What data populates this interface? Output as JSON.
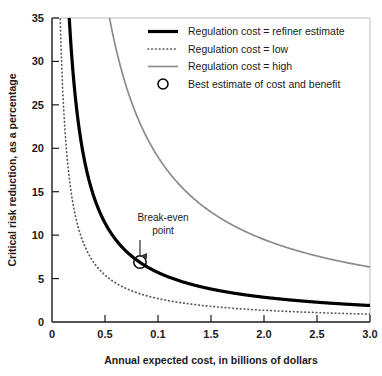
{
  "chart_data": {
    "type": "line",
    "title": "",
    "xlabel": "Annual expected cost, in billions of dollars",
    "ylabel": "Critical risk reduction, as a percentage",
    "xlim": [
      0,
      3.0
    ],
    "ylim": [
      0,
      35
    ],
    "xticks": [
      0,
      0.5,
      1.0,
      1.5,
      2.0,
      2.5,
      3.0
    ],
    "xtick_labels": [
      "0",
      "0.5",
      "0.1",
      "1.5",
      "2.0",
      "2.5",
      "3.0"
    ],
    "yticks": [
      0,
      5,
      10,
      15,
      20,
      25,
      30,
      35
    ],
    "ytick_labels": [
      "0",
      "5",
      "10",
      "15",
      "20",
      "25",
      "30",
      "35"
    ],
    "grid": false,
    "legend_position": "top-right",
    "series": [
      {
        "name": "Regulation cost = refiner estimate",
        "style": "solid-thick-black",
        "color": "#000000",
        "constant_k": 5.7,
        "x": [
          0.16,
          0.2,
          0.25,
          0.3,
          0.35,
          0.4,
          0.5,
          0.6,
          0.7,
          0.83,
          1.0,
          1.25,
          1.5,
          1.75,
          2.0,
          2.25,
          2.5,
          2.75,
          3.0
        ],
        "y": [
          35.0,
          28.5,
          22.8,
          19.0,
          16.3,
          14.3,
          11.4,
          9.5,
          8.1,
          6.9,
          5.7,
          4.6,
          3.8,
          3.3,
          2.9,
          2.5,
          2.3,
          2.1,
          1.9
        ]
      },
      {
        "name": "Regulation cost = low",
        "style": "dotted-gray",
        "color": "#5a5a5a",
        "constant_k": 2.7,
        "x": [
          0.09,
          0.12,
          0.15,
          0.2,
          0.25,
          0.3,
          0.4,
          0.5,
          0.6,
          0.8,
          1.0,
          1.25,
          1.5,
          1.75,
          2.0,
          2.25,
          2.5,
          2.75,
          3.0
        ],
        "y": [
          30.0,
          22.5,
          18.0,
          13.5,
          10.8,
          9.0,
          6.8,
          5.4,
          4.5,
          3.4,
          2.7,
          2.2,
          1.8,
          1.5,
          1.35,
          1.2,
          1.1,
          1.0,
          0.9
        ]
      },
      {
        "name": "Regulation cost = high",
        "style": "solid-thin-gray",
        "color": "#8c8c8c",
        "constant_k": 19.0,
        "x": [
          0.54,
          0.6,
          0.7,
          0.8,
          0.9,
          1.0,
          1.2,
          1.4,
          1.6,
          1.8,
          2.0,
          2.2,
          2.4,
          2.6,
          2.8,
          3.0
        ],
        "y": [
          35.0,
          31.7,
          27.1,
          23.8,
          21.1,
          19.0,
          15.8,
          13.6,
          11.9,
          10.6,
          9.5,
          8.6,
          7.9,
          7.3,
          6.8,
          6.3
        ]
      }
    ],
    "markers": [
      {
        "name": "Best estimate of cost and benefit",
        "style": "open-circle",
        "x": 0.83,
        "y": 6.9
      }
    ],
    "annotations": [
      {
        "name": "break-even",
        "text_line1": "Break-even",
        "text_line2": "point",
        "target_x": 0.83,
        "target_y": 6.9
      }
    ],
    "legend_entries": [
      {
        "label": "Regulation cost = refiner estimate",
        "style": "solid-thick-black"
      },
      {
        "label": "Regulation cost = low",
        "style": "dotted-gray"
      },
      {
        "label": "Regulation cost = high",
        "style": "solid-thin-gray"
      },
      {
        "label": "Best estimate of cost and benefit",
        "style": "open-circle"
      }
    ]
  },
  "colors": {
    "axis": "#1a1a1a",
    "curve_refiner": "#000000",
    "curve_low": "#5a5a5a",
    "curve_high": "#8c8c8c",
    "background": "#ffffff"
  }
}
